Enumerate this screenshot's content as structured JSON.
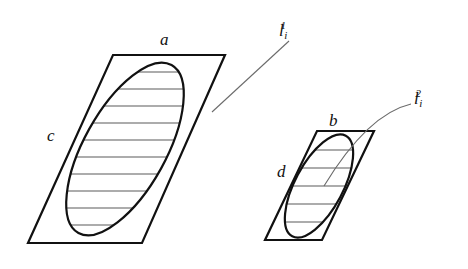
{
  "figure": {
    "background_color": "#ffffff",
    "stroke_color": "#111111",
    "hatch_color": "#5a5a5a",
    "leader_color": "#6b6b6b",
    "canvas": {
      "width": 468,
      "height": 269
    }
  },
  "shapes": {
    "large": {
      "name": "large-parallelogram",
      "corners": [
        [
          113,
          55
        ],
        [
          225,
          55
        ],
        [
          142,
          243
        ],
        [
          28,
          243
        ]
      ],
      "ellipse": {
        "center": [
          125,
          149
        ],
        "rx": 96,
        "ry": 41,
        "rotation_deg": -61
      },
      "hatch_line_count": 11
    },
    "small": {
      "name": "small-parallelogram",
      "corners": [
        [
          317,
          131
        ],
        [
          374,
          131
        ],
        [
          322,
          240
        ],
        [
          265,
          240
        ]
      ],
      "ellipse": {
        "center": [
          319,
          186
        ],
        "rx": 57,
        "ry": 24,
        "rotation_deg": -62
      },
      "hatch_line_count": 5
    }
  },
  "labels": {
    "a": {
      "text": "a",
      "x": 160,
      "y": 31
    },
    "b": {
      "text": "b",
      "x": 329,
      "y": 112
    },
    "c": {
      "text": "c",
      "x": 47,
      "y": 127
    },
    "d": {
      "text": "d",
      "x": 277,
      "y": 163
    },
    "l1": {
      "base": "l",
      "sub": "i",
      "sup": "1",
      "x": 279,
      "y": 20
    },
    "l2": {
      "base": "l",
      "sub": "i",
      "sup": "2",
      "x": 414,
      "y": 88
    }
  },
  "leaders": {
    "l1_path": "M 289 41 L 212 112",
    "l2_path": "M 411 104 C 385 110, 355 135, 324 186"
  }
}
